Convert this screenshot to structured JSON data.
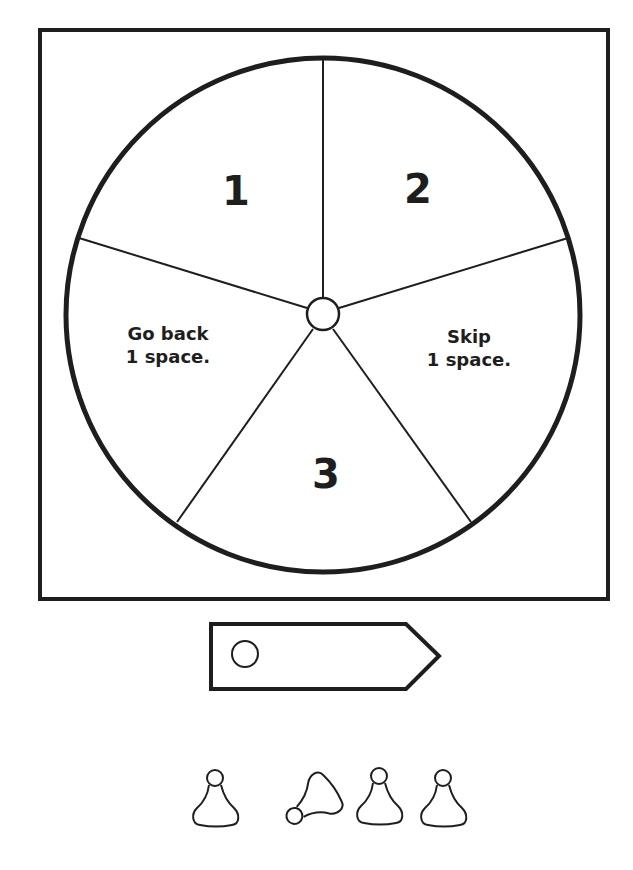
{
  "spinner": {
    "sections": [
      {
        "id": "1",
        "label": "1"
      },
      {
        "id": "2",
        "label": "2"
      },
      {
        "id": "skip",
        "line1": "Skip",
        "line2": "1 space."
      },
      {
        "id": "3",
        "label": "3"
      },
      {
        "id": "goback",
        "line1": "Go back",
        "line2": "1 space."
      }
    ]
  },
  "pointer": {
    "shape": "arrow"
  },
  "pawns": {
    "count": 4
  },
  "colors": {
    "ink": "#1e1e1e",
    "paper": "#ffffff"
  }
}
